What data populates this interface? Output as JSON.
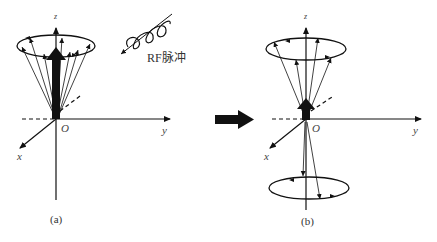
{
  "figure": {
    "panels": [
      {
        "id": "a",
        "label": "(a)",
        "axes": {
          "z": "z",
          "y": "y",
          "x": "x",
          "origin": "O"
        },
        "description": "Net magnetization vector along +z with spins precessing in a cone around z"
      },
      {
        "id": "b",
        "label": "(b)",
        "axes": {
          "z": "z",
          "y": "y",
          "x": "x",
          "origin": "O"
        },
        "description": "After RF pulse: reduced net magnetization; spins split into parallel (upper cone) and anti-parallel (lower cone) precession"
      }
    ],
    "rf_pulse": {
      "label": "RF脉冲"
    },
    "transition_arrow": "right-arrow",
    "colors": {
      "ink": "#111111",
      "background": "#ffffff",
      "label": "#444444"
    }
  }
}
